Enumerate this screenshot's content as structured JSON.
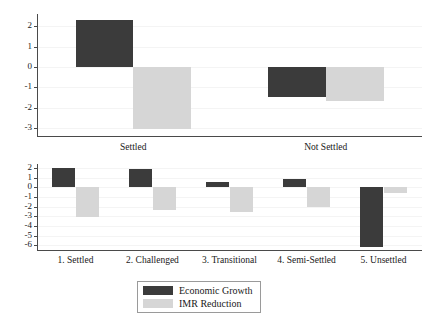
{
  "chart_data": [
    {
      "id": "top",
      "type": "bar",
      "title": "",
      "xlabel": "",
      "ylabel": "",
      "categories": [
        "Settled",
        "Not Settled"
      ],
      "series": [
        {
          "name": "Economic Growth",
          "color": "#3b3b3b",
          "values": [
            2.3,
            -1.5
          ]
        },
        {
          "name": "IMR Reduction",
          "color": "#d6d6d6",
          "values": [
            -3.05,
            -1.7
          ]
        }
      ],
      "ylim": [
        -3.4,
        2.6
      ],
      "yticks": [
        2,
        1,
        0,
        -1,
        -2,
        -3
      ],
      "ytick_labels": [
        "2",
        "1",
        "0",
        "-1",
        "-2",
        "-3"
      ],
      "grid": true,
      "legend": "none"
    },
    {
      "id": "bottom",
      "type": "bar",
      "title": "",
      "xlabel": "",
      "ylabel": "",
      "categories": [
        "1. Settled",
        "2. Challenged",
        "3. Transitional",
        "4. Semi-Settled",
        "5. Unsettled"
      ],
      "series": [
        {
          "name": "Economic Growth",
          "color": "#3b3b3b",
          "values": [
            2.0,
            1.9,
            0.5,
            0.8,
            -6.2
          ]
        },
        {
          "name": "IMR Reduction",
          "color": "#d6d6d6",
          "values": [
            -3.1,
            -2.4,
            -2.6,
            -2.1,
            -0.6
          ]
        }
      ],
      "ylim": [
        -6.5,
        2.4
      ],
      "yticks": [
        2,
        1,
        0,
        -1,
        -2,
        -3,
        -4,
        -5,
        -6
      ],
      "ytick_labels": [
        "2",
        "1",
        "0",
        "-1",
        "-2",
        "-3",
        "-4",
        "-5",
        "-6"
      ],
      "grid": true,
      "legend": "bottom-center"
    }
  ],
  "legend": {
    "entries": [
      {
        "label": "Economic Growth",
        "swatch": "dark"
      },
      {
        "label": "IMR Reduction",
        "swatch": "light"
      }
    ]
  }
}
